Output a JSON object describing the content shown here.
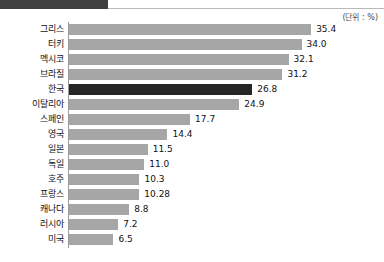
{
  "header": {
    "strip_text": "",
    "unit_note": "(단위 : %)"
  },
  "chart_data": {
    "type": "bar",
    "orientation": "horizontal",
    "title": "",
    "subtitle": "",
    "xlabel": "",
    "ylabel": "",
    "unit_label": "(단위 : %)",
    "grid": false,
    "legend": null,
    "xlim": [
      0,
      35.4
    ],
    "highlight_category": "한국",
    "highlight_color": "#262626",
    "bar_color": "#a6a6a6",
    "categories": [
      "그리스",
      "터키",
      "멕시코",
      "브라질",
      "한국",
      "이탈리아",
      "스페인",
      "영국",
      "일본",
      "독일",
      "호주",
      "프랑스",
      "캐나다",
      "러시아",
      "미국"
    ],
    "values": [
      35.4,
      34.0,
      32.1,
      31.2,
      26.8,
      24.9,
      17.7,
      14.4,
      11.5,
      11.0,
      10.3,
      10.28,
      8.8,
      7.2,
      6.5
    ],
    "value_labels": [
      "35.4",
      "34.0",
      "32.1",
      "31.2",
      "26.8",
      "24.9",
      "17.7",
      "14.4",
      "11.5",
      "11.0",
      "10.3",
      "10.28",
      "8.8",
      "7.2",
      "6.5"
    ]
  }
}
